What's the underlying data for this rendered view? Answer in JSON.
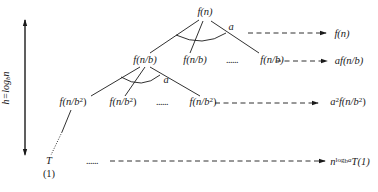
{
  "diagram": {
    "type": "recursion-tree",
    "height_label": {
      "prefix": "h=log",
      "sub": "b",
      "suffix": "n"
    },
    "root": {
      "label": "f(n)"
    },
    "branch_label": "a",
    "level1": {
      "nodes": [
        "f(n/b)",
        "f(n/b)",
        "f(n/b)"
      ],
      "ellipsis": "......"
    },
    "level2": {
      "nodes": [
        {
          "pre": "f(n/b",
          "sup": "2",
          "post": ")"
        },
        {
          "pre": "f(n/b",
          "sup": "2",
          "post": ")"
        },
        {
          "pre": "f(n/b",
          "sup": "2",
          "post": ")"
        }
      ],
      "ellipsis": "......"
    },
    "leaf": {
      "label": "T",
      "sub_label": "(1)"
    },
    "leaf_ellipsis": "......",
    "level_costs": [
      {
        "text": "f(n)"
      },
      {
        "text": "af(n/b)"
      },
      {
        "pre": "a",
        "sup": "2",
        "mid": "f(n/b",
        "sup2": "2",
        "post": ")"
      },
      {
        "pre": "n",
        "sup": "log",
        "sup_sub": "b",
        "sup_tail": "a",
        "post": "T(1)"
      }
    ]
  }
}
